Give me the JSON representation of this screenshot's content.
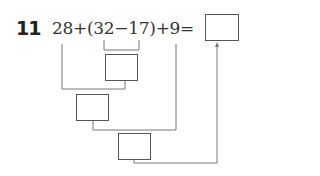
{
  "problem": {
    "number": "11",
    "expression": "28+(32−17)+9=",
    "steps": [
      {
        "operation": "32−17",
        "answer": ""
      },
      {
        "operation": "28+step1",
        "answer": ""
      },
      {
        "operation": "step2+9",
        "answer": ""
      }
    ],
    "final_answer": ""
  }
}
